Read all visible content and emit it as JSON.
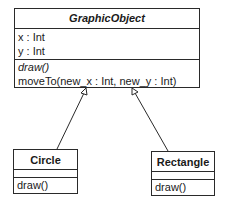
{
  "diagram": {
    "type": "uml-class-diagram",
    "classes": [
      {
        "id": "graphic-object",
        "name": "GraphicObject",
        "abstract": true,
        "attributes": [
          "x : Int",
          "y : Int"
        ],
        "operations": [
          {
            "label": "draw()",
            "abstract": true
          },
          {
            "label": "moveTo(new_x : Int, new_y : Int)",
            "abstract": false
          }
        ]
      },
      {
        "id": "circle",
        "name": "Circle",
        "abstract": false,
        "attributes": [],
        "operations": [
          {
            "label": "draw()",
            "abstract": false
          }
        ]
      },
      {
        "id": "rectangle",
        "name": "Rectangle",
        "abstract": false,
        "attributes": [],
        "operations": [
          {
            "label": "draw()",
            "abstract": false
          }
        ]
      }
    ],
    "relationships": [
      {
        "type": "generalization",
        "from": "Circle",
        "to": "GraphicObject"
      },
      {
        "type": "generalization",
        "from": "Rectangle",
        "to": "GraphicObject"
      }
    ],
    "colors": {
      "line": "#2a2a2a",
      "background": "#ffffff",
      "text": "#1a1a1a"
    }
  }
}
